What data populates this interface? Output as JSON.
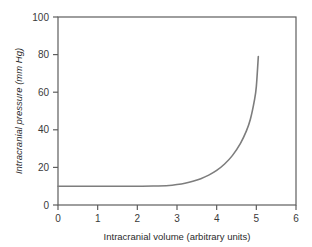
{
  "chart_data": {
    "type": "line",
    "title": "",
    "subtitle": "",
    "xlabel": "Intracranial volume (arbitrary units)",
    "ylabel": "Intracranial pressure (mm Hg)",
    "xlim": [
      0,
      6
    ],
    "ylim": [
      0,
      100
    ],
    "xticks": [
      "0",
      "1",
      "2",
      "3",
      "4",
      "5",
      "6"
    ],
    "yticks": [
      "0",
      "20",
      "40",
      "60",
      "80",
      "100"
    ],
    "xtick_values": [
      0,
      1,
      2,
      3,
      4,
      5,
      6
    ],
    "ytick_values": [
      0,
      20,
      40,
      60,
      80,
      100
    ],
    "grid": false,
    "legend": false,
    "legend_position": "none",
    "annotations": [],
    "series": [
      {
        "name": "Intracranial pressure–volume curve",
        "color": "#7d7d7d",
        "x": [
          0.0,
          0.5,
          1.0,
          1.5,
          2.0,
          2.4,
          2.8,
          3.0,
          3.2,
          3.4,
          3.6,
          3.8,
          4.0,
          4.2,
          4.4,
          4.6,
          4.75,
          4.85,
          4.95,
          5.0,
          5.05
        ],
        "values": [
          10,
          10,
          10,
          10,
          10,
          10.1,
          10.4,
          10.9,
          11.6,
          12.6,
          14.0,
          15.9,
          18.4,
          21.8,
          26.4,
          32.8,
          39.4,
          45.6,
          55.5,
          63.0,
          79.0
        ]
      }
    ]
  },
  "axes": {
    "frame_color": "#5e5e5e",
    "tick_color": "#5e5e5e",
    "label_color": "#2b2b2b",
    "background": "#ffffff"
  }
}
